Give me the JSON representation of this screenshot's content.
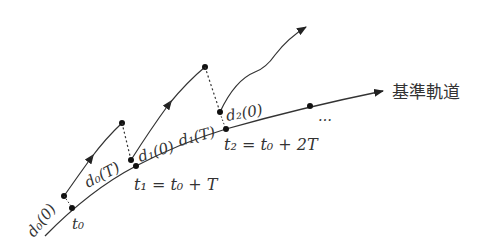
{
  "diagram": {
    "reference_orbit_label": "基準軌道",
    "ellipsis": "…",
    "time_labels": [
      {
        "id": "t0",
        "text": "t₀"
      },
      {
        "id": "t1",
        "text": "t₁ = t₀ + T"
      },
      {
        "id": "t2",
        "text": "t₂ = t₀ + 2T"
      }
    ],
    "deviation_labels": [
      {
        "id": "d0_0",
        "text": "d₀(0)"
      },
      {
        "id": "d0_T",
        "text": "d₀(T)"
      },
      {
        "id": "d1_0",
        "text": "d₁(0)"
      },
      {
        "id": "d1_T",
        "text": "d₁(T)"
      },
      {
        "id": "d2_0",
        "text": "d₂(0)"
      }
    ],
    "colors": {
      "stroke": "#333333",
      "text": "#333333",
      "background": "#ffffff"
    }
  }
}
